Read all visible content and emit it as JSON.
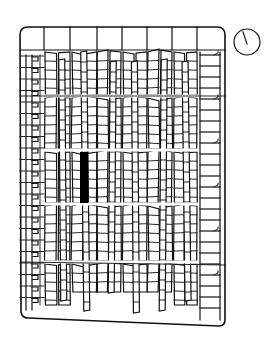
{
  "diagram": {
    "type": "floor-plan",
    "colors": {
      "line": "#111111",
      "background": "#ffffff",
      "highlight": "#000000"
    },
    "frame": {
      "x1": 20,
      "y1": 27,
      "x2": 225,
      "y_bottom_left": 318,
      "y_bottom_right": 326,
      "corner_radius": 8
    },
    "header_row": {
      "y1": 27,
      "y2": 50,
      "dividers_x": [
        44,
        70,
        97,
        122,
        147,
        172,
        197
      ]
    },
    "aisles_y": [
      96,
      150,
      204,
      262
    ],
    "compass": {
      "cx": 247,
      "cy": 42,
      "r": 13,
      "needle": {
        "x1": 243,
        "y1": 32,
        "x2": 247,
        "y2": 44
      }
    },
    "highlight_block": {
      "x": 80,
      "y": 152,
      "width": 8,
      "height": 51
    },
    "columns": [
      {
        "name": "left-wall-column",
        "x1": 22,
        "x2": 44
      },
      {
        "name": "column-1",
        "x1": 45,
        "x2": 70
      },
      {
        "name": "column-2",
        "x1": 72,
        "x2": 97
      },
      {
        "name": "column-3",
        "x1": 97,
        "x2": 121
      },
      {
        "name": "column-4",
        "x1": 123,
        "x2": 147
      },
      {
        "name": "column-5",
        "x1": 148,
        "x2": 172
      },
      {
        "name": "column-6",
        "x1": 174,
        "x2": 197
      },
      {
        "name": "right-wall-column",
        "x1": 199,
        "x2": 222
      }
    ]
  }
}
